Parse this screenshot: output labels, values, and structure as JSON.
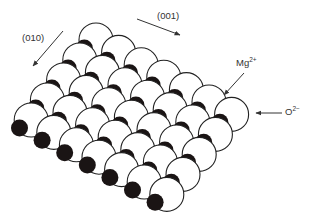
{
  "figure": {
    "labels": {
      "direction_010": "(010)",
      "direction_001": "(001)",
      "cation_base": "Mg",
      "cation_charge": "2+",
      "anion_base": "O",
      "anion_charge": "2−"
    },
    "colors": {
      "anion_fill": "#ffffff",
      "anion_stroke": "#222222",
      "cation_fill": "#1a1414",
      "arrow": "#333333"
    },
    "lattice": {
      "origin": [
        96,
        40
      ],
      "step_a": [
        22.6,
        12.4
      ],
      "step_b": [
        -16.2,
        20.0
      ],
      "count_a": 7,
      "count_b": 5,
      "anion_radius": 17,
      "cation_radius": 8.5
    },
    "legend": {
      "anion": "O2- (large white spheres)",
      "cation": "Mg2+ (small black spheres)"
    }
  }
}
